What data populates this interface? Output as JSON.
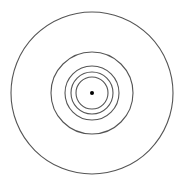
{
  "diagram": {
    "type": "concentric-circles",
    "background": "#ffffff",
    "stroke_color": "#555555",
    "center": {
      "x": 92,
      "y": 93
    },
    "center_dot": {
      "radius": 2,
      "color": "#000000"
    },
    "circles": [
      {
        "radius": 81
      },
      {
        "radius": 41
      },
      {
        "radius": 27
      },
      {
        "radius": 21
      },
      {
        "radius": 16
      }
    ]
  }
}
